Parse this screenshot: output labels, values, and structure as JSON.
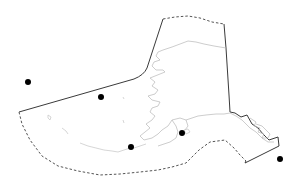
{
  "map": {
    "region": "Alaska",
    "background_color": "#ffffff",
    "boundary_color": "#3a3a3a",
    "coastline_color": "#b8b8b8",
    "marker_color": "#000000",
    "markers": [
      {
        "id": "marker-1",
        "x": 28,
        "y": 82,
        "r": 3
      },
      {
        "id": "marker-2",
        "x": 101,
        "y": 97,
        "r": 3
      },
      {
        "id": "marker-3",
        "x": 131,
        "y": 147,
        "r": 3
      },
      {
        "id": "marker-4",
        "x": 182,
        "y": 133,
        "r": 3
      },
      {
        "id": "marker-5",
        "x": 280,
        "y": 159,
        "r": 3
      }
    ]
  }
}
